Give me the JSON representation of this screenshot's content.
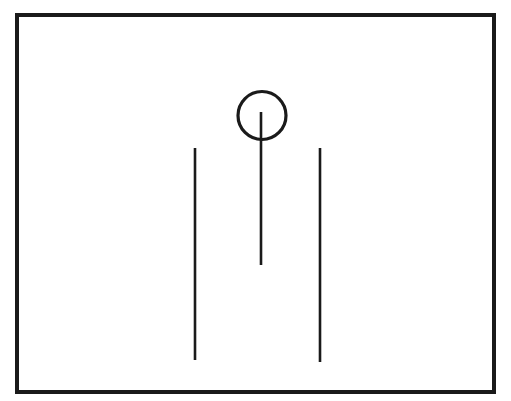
{
  "canvas": {
    "width": 511,
    "height": 401,
    "background_color": "#ffffff",
    "description": "Black-and-white line drawing on white background"
  },
  "figure": {
    "stroke_color": "#1a1a1a",
    "fill": "none",
    "elements": [
      {
        "name": "frame",
        "shape": "rectangle",
        "x": 17,
        "y": 15,
        "width": 477,
        "height": 377,
        "stroke_width": 3.2,
        "stroke_color": "#1a1a1a",
        "fill": "none"
      },
      {
        "name": "circle-head",
        "shape": "circle",
        "cx": 262,
        "cy": 115.5,
        "r": 24,
        "stroke_width": 3.2,
        "stroke_color": "#1a1a1a",
        "fill": "none"
      },
      {
        "name": "center-stem-line",
        "shape": "line",
        "x1": 261,
        "y1": 112,
        "x2": 261,
        "y2": 265,
        "stroke_width": 2.6,
        "stroke_color": "#1a1a1a"
      },
      {
        "name": "left-vertical-line",
        "shape": "line",
        "x1": 195,
        "y1": 148,
        "x2": 195,
        "y2": 360,
        "stroke_width": 2.6,
        "stroke_color": "#1a1a1a"
      },
      {
        "name": "right-vertical-line",
        "shape": "line",
        "x1": 320,
        "y1": 148,
        "x2": 320,
        "y2": 362,
        "stroke_width": 2.6,
        "stroke_color": "#1a1a1a"
      }
    ]
  }
}
